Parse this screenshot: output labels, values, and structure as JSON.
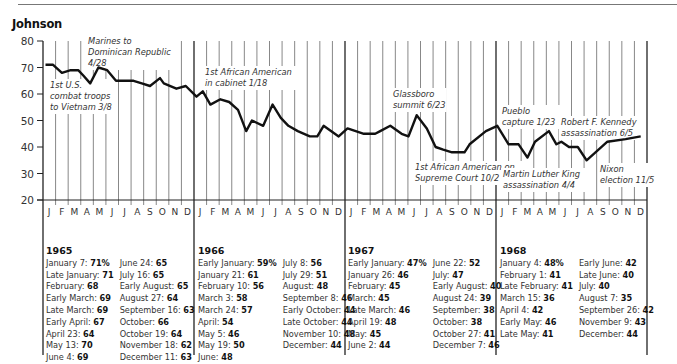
{
  "header": {
    "title": "Johnson"
  },
  "chart_data": {
    "type": "line",
    "title": "Johnson",
    "xlabel": "",
    "ylabel": "",
    "ylim": [
      20,
      80
    ],
    "yticks": [
      80,
      70,
      60,
      50,
      40,
      30,
      20
    ],
    "grid": "vertical monthly lines",
    "years": [
      "1965",
      "1966",
      "1967",
      "1968"
    ],
    "month_labels": [
      "J",
      "F",
      "M",
      "A",
      "M",
      "J",
      "J",
      "A",
      "S",
      "O",
      "N",
      "D"
    ],
    "series": [
      {
        "name": "Approval rating (%)",
        "points": [
          {
            "m": 0.2,
            "v": 71
          },
          {
            "m": 0.8,
            "v": 71
          },
          {
            "m": 1.5,
            "v": 68
          },
          {
            "m": 2.2,
            "v": 69
          },
          {
            "m": 2.8,
            "v": 69
          },
          {
            "m": 3.2,
            "v": 67
          },
          {
            "m": 3.75,
            "v": 64
          },
          {
            "m": 4.4,
            "v": 70
          },
          {
            "m": 5.1,
            "v": 69
          },
          {
            "m": 5.8,
            "v": 65
          },
          {
            "m": 6.5,
            "v": 65
          },
          {
            "m": 7.2,
            "v": 65
          },
          {
            "m": 7.85,
            "v": 64
          },
          {
            "m": 8.5,
            "v": 63
          },
          {
            "m": 9.3,
            "v": 66
          },
          {
            "m": 9.6,
            "v": 64
          },
          {
            "m": 10.6,
            "v": 62
          },
          {
            "m": 11.35,
            "v": 63
          },
          {
            "m": 12.2,
            "v": 59
          },
          {
            "m": 12.7,
            "v": 61
          },
          {
            "m": 13.3,
            "v": 56
          },
          {
            "m": 14.1,
            "v": 58
          },
          {
            "m": 14.8,
            "v": 57
          },
          {
            "m": 15.5,
            "v": 54
          },
          {
            "m": 16.15,
            "v": 46
          },
          {
            "m": 16.6,
            "v": 50
          },
          {
            "m": 17.5,
            "v": 48
          },
          {
            "m": 18.25,
            "v": 56
          },
          {
            "m": 18.9,
            "v": 51
          },
          {
            "m": 19.5,
            "v": 48
          },
          {
            "m": 20.25,
            "v": 46
          },
          {
            "m": 21.2,
            "v": 44
          },
          {
            "m": 21.8,
            "v": 44
          },
          {
            "m": 22.3,
            "v": 48
          },
          {
            "m": 23.5,
            "v": 44
          },
          {
            "m": 24.2,
            "v": 47
          },
          {
            "m": 24.85,
            "v": 46
          },
          {
            "m": 25.5,
            "v": 45
          },
          {
            "m": 26.4,
            "v": 45
          },
          {
            "m": 26.8,
            "v": 46
          },
          {
            "m": 27.6,
            "v": 48
          },
          {
            "m": 28.5,
            "v": 45
          },
          {
            "m": 29.05,
            "v": 44
          },
          {
            "m": 29.7,
            "v": 52
          },
          {
            "m": 30.5,
            "v": 47
          },
          {
            "m": 31.2,
            "v": 40
          },
          {
            "m": 31.8,
            "v": 39
          },
          {
            "m": 32.5,
            "v": 38
          },
          {
            "m": 33.5,
            "v": 38
          },
          {
            "m": 33.9,
            "v": 41
          },
          {
            "m": 35.2,
            "v": 46
          },
          {
            "m": 36.1,
            "v": 48
          },
          {
            "m": 37.0,
            "v": 41
          },
          {
            "m": 37.8,
            "v": 41
          },
          {
            "m": 38.5,
            "v": 36
          },
          {
            "m": 39.1,
            "v": 42
          },
          {
            "m": 40.2,
            "v": 46
          },
          {
            "m": 40.8,
            "v": 41
          },
          {
            "m": 41.2,
            "v": 42
          },
          {
            "m": 41.8,
            "v": 40
          },
          {
            "m": 42.5,
            "v": 40
          },
          {
            "m": 43.2,
            "v": 35
          },
          {
            "m": 44.85,
            "v": 42
          },
          {
            "m": 46.3,
            "v": 43
          },
          {
            "m": 47.5,
            "v": 44
          }
        ]
      }
    ],
    "annotations": [
      {
        "lines": [
          "1st U.S.",
          "combat troops",
          "to Vietnam 3/8"
        ],
        "x": 50,
        "y": 88
      },
      {
        "lines": [
          "Marines to",
          "Dominican Republic",
          "4/28"
        ],
        "x": 88,
        "y": 44
      },
      {
        "lines": [
          "1st African American",
          "in cabinet 1/18"
        ],
        "x": 205,
        "y": 75
      },
      {
        "lines": [
          "Glassboro",
          "summit 6/23"
        ],
        "x": 393,
        "y": 97
      },
      {
        "lines": [
          "1st African American on",
          "Supreme Court 10/2"
        ],
        "x": 415,
        "y": 170
      },
      {
        "lines": [
          "Pueblo",
          "capture 1/23"
        ],
        "x": 502,
        "y": 114
      },
      {
        "lines": [
          "Martin Luther King",
          "assassination 4/4"
        ],
        "x": 503,
        "y": 177
      },
      {
        "lines": [
          "Robert F. Kennedy",
          "assassination 6/5"
        ],
        "x": 561,
        "y": 125
      },
      {
        "lines": [
          "Nixon",
          "election 11/5"
        ],
        "x": 600,
        "y": 172
      }
    ]
  },
  "tables": [
    {
      "year": "1965",
      "col1": [
        {
          "label": "January 7:",
          "value": "71%"
        },
        {
          "label": "Late January:",
          "value": "71"
        },
        {
          "label": "February:",
          "value": "68"
        },
        {
          "label": "Early March:",
          "value": "69"
        },
        {
          "label": "Late March:",
          "value": "69"
        },
        {
          "label": "Early April:",
          "value": "67"
        },
        {
          "label": "April 23:",
          "value": "64"
        },
        {
          "label": "May 13:",
          "value": "70"
        },
        {
          "label": "June 4:",
          "value": "69"
        }
      ],
      "col2": [
        {
          "label": "June 24:",
          "value": "65"
        },
        {
          "label": "July 16:",
          "value": "65"
        },
        {
          "label": "Early August:",
          "value": "65"
        },
        {
          "label": "August 27:",
          "value": "64"
        },
        {
          "label": "September 16:",
          "value": "63"
        },
        {
          "label": "October:",
          "value": "66"
        },
        {
          "label": "October 19:",
          "value": "64"
        },
        {
          "label": "November 18:",
          "value": "62"
        },
        {
          "label": "December 11:",
          "value": "63"
        }
      ]
    },
    {
      "year": "1966",
      "col1": [
        {
          "label": "Early January:",
          "value": "59%"
        },
        {
          "label": "January 21:",
          "value": "61"
        },
        {
          "label": "February 10:",
          "value": "56"
        },
        {
          "label": "March 3:",
          "value": "58"
        },
        {
          "label": "March 24:",
          "value": "57"
        },
        {
          "label": "April:",
          "value": "54"
        },
        {
          "label": "May 5:",
          "value": "46"
        },
        {
          "label": "May 19:",
          "value": "50"
        },
        {
          "label": "June:",
          "value": "48"
        }
      ],
      "col2": [
        {
          "label": "July 8:",
          "value": "56"
        },
        {
          "label": "July 29:",
          "value": "51"
        },
        {
          "label": "August:",
          "value": "48"
        },
        {
          "label": "September 8:",
          "value": "46"
        },
        {
          "label": "Early October:",
          "value": "44"
        },
        {
          "label": "Late October:",
          "value": "44"
        },
        {
          "label": "November 10:",
          "value": "48"
        },
        {
          "label": "December:",
          "value": "44"
        }
      ]
    },
    {
      "year": "1967",
      "col1": [
        {
          "label": "Early January:",
          "value": "47%"
        },
        {
          "label": "January 26:",
          "value": "46"
        },
        {
          "label": "February:",
          "value": "45"
        },
        {
          "label": "March:",
          "value": "45"
        },
        {
          "label": "Late March:",
          "value": "46"
        },
        {
          "label": "April 19:",
          "value": "48"
        },
        {
          "label": "May:",
          "value": "45"
        },
        {
          "label": "June 2:",
          "value": "44"
        }
      ],
      "col2": [
        {
          "label": "June 22:",
          "value": "52"
        },
        {
          "label": "July:",
          "value": "47"
        },
        {
          "label": "Early August:",
          "value": "40"
        },
        {
          "label": "August 24:",
          "value": "39"
        },
        {
          "label": "September:",
          "value": "38"
        },
        {
          "label": "October:",
          "value": "38"
        },
        {
          "label": "October 27:",
          "value": "41"
        },
        {
          "label": "December 7:",
          "value": "46"
        }
      ]
    },
    {
      "year": "1968",
      "col1": [
        {
          "label": "January 4:",
          "value": "48%"
        },
        {
          "label": "February 1:",
          "value": "41"
        },
        {
          "label": "Late February:",
          "value": "41"
        },
        {
          "label": "March 15:",
          "value": "36"
        },
        {
          "label": "April 4:",
          "value": "42"
        },
        {
          "label": "Early May:",
          "value": "46"
        },
        {
          "label": "Late May:",
          "value": "41"
        }
      ],
      "col2": [
        {
          "label": "Early June:",
          "value": "42"
        },
        {
          "label": "Late June:",
          "value": "40"
        },
        {
          "label": "July:",
          "value": "40"
        },
        {
          "label": "August 7:",
          "value": "35"
        },
        {
          "label": "September 26:",
          "value": "42"
        },
        {
          "label": "November 9:",
          "value": "43"
        },
        {
          "label": "December:",
          "value": "44"
        }
      ]
    }
  ],
  "colors": {
    "line": "#111111",
    "grid": "#555555",
    "text": "#333333"
  }
}
